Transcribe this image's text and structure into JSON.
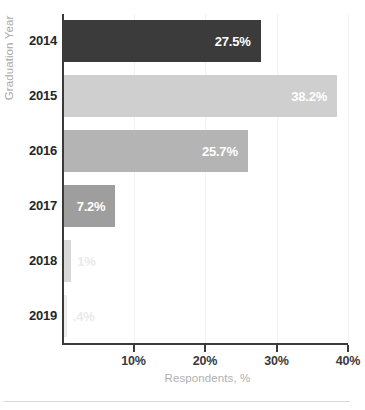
{
  "chart_data": {
    "type": "bar",
    "orientation": "horizontal",
    "title": "",
    "xlabel": "Respondents, %",
    "ylabel": "Graduation Year",
    "categories": [
      "2014",
      "2015",
      "2016",
      "2017",
      "2018",
      "2019"
    ],
    "values": [
      27.5,
      38.2,
      25.7,
      7.2,
      1.0,
      0.4
    ],
    "data_labels": [
      "27.5%",
      "38.2%",
      "25.7%",
      "7.2%",
      "1%",
      ".4%"
    ],
    "bar_colors": [
      "#3b3b3b",
      "#cfcfcf",
      "#b4b4b4",
      "#9e9e9e",
      "#d8d8d8",
      "#ececec"
    ],
    "label_placement": [
      "inside",
      "inside",
      "inside",
      "inside",
      "outside",
      "outside"
    ],
    "xlim": [
      0,
      40
    ],
    "xticks": [
      10,
      20,
      30,
      40
    ],
    "xtick_labels": [
      "10%",
      "20%",
      "30%",
      "40%"
    ],
    "grid": true,
    "grid_axis": "x",
    "legend": "none"
  }
}
